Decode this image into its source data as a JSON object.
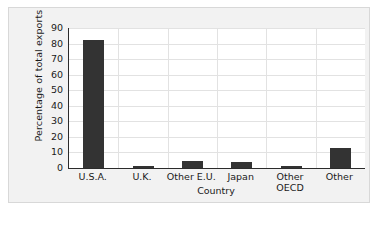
{
  "chart_data": {
    "type": "bar",
    "title": "",
    "subtitle": "",
    "xlabel": "Country",
    "ylabel": "Percentage of total exports",
    "categories": [
      "U.S.A.",
      "U.K.",
      "Other E.U.",
      "Japan",
      "Other\nOECD",
      "Other"
    ],
    "values": [
      82,
      1.5,
      4.5,
      4,
      1.5,
      13
    ],
    "ylim": [
      0,
      90
    ],
    "ytick_labels": [
      "0",
      "10",
      "20",
      "30",
      "40",
      "50",
      "60",
      "70",
      "80",
      "90"
    ],
    "ytick_values": [
      0,
      10,
      20,
      30,
      40,
      50,
      60,
      70,
      80,
      90
    ],
    "grid": true,
    "grid_axis": "both",
    "legend": false,
    "legend_position": "none",
    "bar_color": "#333333",
    "grid_color": "#e2e2e2",
    "axis_color": "#2b2b2b",
    "plot_background": "#ffffff",
    "figure_background": "#f2f2f2"
  }
}
